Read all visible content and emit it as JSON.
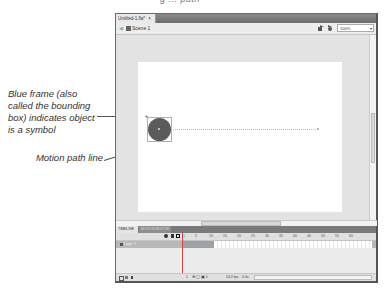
{
  "top_caption": "g ... path",
  "window": {
    "doc_tab": "Untitled-1.fla*",
    "doc_tab_close": "×",
    "scene": "Scene 1",
    "zoom_value": "100%",
    "panel_tabs": [
      "TIMELINE",
      "MOTION EDITOR"
    ],
    "layer_name": "Layer 1",
    "frame_numbers": [
      "1",
      "5",
      "10",
      "15",
      "20",
      "25",
      "30",
      "35",
      "40",
      "45",
      "50",
      "55",
      "60"
    ],
    "footer": {
      "current_frame": "1",
      "fps": "24.0 fps",
      "time": "0.0s"
    }
  },
  "annotations": [
    {
      "id": "bounding-box",
      "text": "Blue frame (also called the bounding box) indicates object is a symbol"
    },
    {
      "id": "motion-path",
      "text": "Motion path line"
    }
  ],
  "colors": {
    "symbol_fill": "#5b5b5b",
    "stage": "#ffffff",
    "pasteboard": "#e3e3e3",
    "tween_span": "#9ea0a8"
  }
}
